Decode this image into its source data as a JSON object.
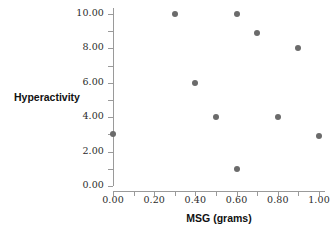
{
  "chart_data": {
    "type": "scatter",
    "title": "",
    "xlabel": "MSG (grams)",
    "ylabel": "Hyperactivity",
    "xlim": [
      0.0,
      1.0
    ],
    "ylim": [
      0.0,
      10.0
    ],
    "grid": false,
    "legend": "none",
    "marker_color": "#6b6b6b",
    "axis_color": "#9a9a9a",
    "xticks": [
      "0.00",
      "0.20",
      "0.40",
      "0.60",
      "0.80",
      "1.00"
    ],
    "xtick_values": [
      0.0,
      0.2,
      0.4,
      0.6,
      0.8,
      1.0
    ],
    "xminor_values": [
      0.0,
      0.1,
      0.2,
      0.3,
      0.4,
      0.5,
      0.6,
      0.7,
      0.8,
      0.9,
      1.0
    ],
    "yticks": [
      "0.00",
      "2.00",
      "4.00",
      "6.00",
      "8.00",
      "10.00"
    ],
    "ytick_values": [
      0.0,
      2.0,
      4.0,
      6.0,
      8.0,
      10.0
    ],
    "yminor_values": [
      0.0,
      1.0,
      2.0,
      3.0,
      4.0,
      5.0,
      6.0,
      7.0,
      8.0,
      9.0,
      10.0
    ],
    "x": [
      0.0,
      0.3,
      0.4,
      0.5,
      0.6,
      0.6,
      0.7,
      0.8,
      0.9,
      1.0
    ],
    "y": [
      3.0,
      10.0,
      6.0,
      4.0,
      10.0,
      1.0,
      8.9,
      4.0,
      8.0,
      2.9
    ],
    "points": [
      {
        "x": 0.0,
        "y": 3.0
      },
      {
        "x": 0.3,
        "y": 10.0
      },
      {
        "x": 0.4,
        "y": 6.0
      },
      {
        "x": 0.5,
        "y": 4.0
      },
      {
        "x": 0.6,
        "y": 10.0
      },
      {
        "x": 0.6,
        "y": 1.0
      },
      {
        "x": 0.7,
        "y": 8.9
      },
      {
        "x": 0.8,
        "y": 4.0
      },
      {
        "x": 0.9,
        "y": 8.0
      },
      {
        "x": 1.0,
        "y": 2.9
      }
    ]
  }
}
